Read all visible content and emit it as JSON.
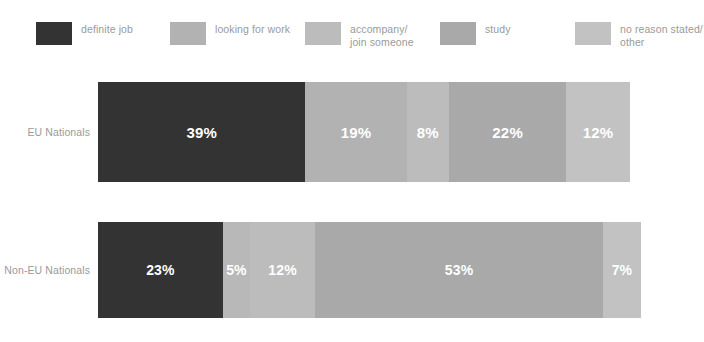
{
  "legend": {
    "items": [
      {
        "label": "definite job",
        "color": "#333333"
      },
      {
        "label": "looking for work",
        "color": "#b2b2b2"
      },
      {
        "label": "accompany/\njoin someone",
        "color": "#bcbcbc"
      },
      {
        "label": "study",
        "color": "#a9a9a9"
      },
      {
        "label": "no reason stated/\nother",
        "color": "#c2c2c2"
      }
    ]
  },
  "chart_data": {
    "type": "bar",
    "subtype": "stacked-horizontal-100",
    "title": "",
    "xlabel": "",
    "ylabel": "",
    "xlim": [
      0,
      100
    ],
    "grid": false,
    "legend_position": "top",
    "categories": [
      "EU Nationals",
      "Non-EU Nationals"
    ],
    "series": [
      {
        "name": "definite job",
        "color": "#333333",
        "values": [
          39,
          23
        ],
        "labels": [
          "39%",
          "23%"
        ]
      },
      {
        "name": "looking for work",
        "color": "#b2b2b2",
        "values": [
          19,
          5
        ],
        "labels": [
          "19%",
          "5%"
        ]
      },
      {
        "name": "accompany/join someone",
        "color": "#bcbcbc",
        "values": [
          8,
          12
        ],
        "labels": [
          "8%",
          "12%"
        ]
      },
      {
        "name": "study",
        "color": "#a9a9a9",
        "values": [
          22,
          53
        ],
        "labels": [
          "22%",
          "53%"
        ]
      },
      {
        "name": "no reason stated/other",
        "color": "#c2c2c2",
        "values": [
          12,
          7
        ],
        "labels": [
          "12%",
          "7%"
        ]
      }
    ],
    "bars": [
      {
        "category": "EU Nationals",
        "segments": [
          {
            "series": "definite job",
            "value": 39,
            "label": "39%",
            "color": "#333333"
          },
          {
            "series": "looking for work",
            "value": 19,
            "label": "19%",
            "color": "#b2b2b2"
          },
          {
            "series": "accompany/join someone",
            "value": 8,
            "label": "8%",
            "color": "#bcbcbc"
          },
          {
            "series": "study",
            "value": 22,
            "label": "22%",
            "color": "#a9a9a9"
          },
          {
            "series": "no reason stated/other",
            "value": 12,
            "label": "12%",
            "color": "#c2c2c2"
          }
        ]
      },
      {
        "category": "Non-EU Nationals",
        "segments": [
          {
            "series": "definite job",
            "value": 23,
            "label": "23%",
            "color": "#333333"
          },
          {
            "series": "looking for work",
            "value": 5,
            "label": "5%",
            "color": "#b8b8b8"
          },
          {
            "series": "accompany/join someone",
            "value": 12,
            "label": "12%",
            "color": "#bcbcbc"
          },
          {
            "series": "study",
            "value": 53,
            "label": "53%",
            "color": "#a9a9a9"
          },
          {
            "series": "no reason stated/other",
            "value": 7,
            "label": "7%",
            "color": "#c2c2c2"
          }
        ]
      }
    ]
  }
}
